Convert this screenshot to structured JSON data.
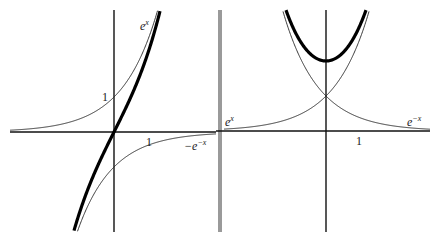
{
  "chart_data": [
    {
      "type": "line",
      "title": "",
      "panel": "left",
      "xlim": [
        -3.2,
        2.9
      ],
      "ylim": [
        -3.2,
        3.7
      ],
      "axes": {
        "x_tick_label": "1",
        "x_tick_value": 1,
        "y_tick_label": "1",
        "y_tick_value": 1
      },
      "series": [
        {
          "name": "e^x",
          "function": "exp(x)",
          "style": "thin",
          "label": {
            "base": "e",
            "exp": "x"
          }
        },
        {
          "name": "-e^-x",
          "function": "-exp(-x)",
          "style": "thin",
          "label": {
            "base": "−e",
            "exp": "−x"
          }
        },
        {
          "name": "sinh-like sum",
          "function": "exp(x) - exp(-x)",
          "style": "thick",
          "label": null
        }
      ]
    },
    {
      "type": "line",
      "title": "",
      "panel": "right",
      "xlim": [
        -3.1,
        3.2
      ],
      "ylim": [
        -3.0,
        3.7
      ],
      "axes": {
        "x_tick_label": "1",
        "x_tick_value": 1
      },
      "series": [
        {
          "name": "e^x",
          "function": "exp(x)",
          "style": "thin",
          "label": {
            "base": "e",
            "exp": "x"
          }
        },
        {
          "name": "e^-x",
          "function": "exp(-x)",
          "style": "thin",
          "label": {
            "base": "e",
            "exp": "−x"
          }
        },
        {
          "name": "cosh-like sum",
          "function": "exp(x) + exp(-x)",
          "style": "thick",
          "label": null
        }
      ]
    }
  ],
  "labels": {
    "left_ex_base": "e",
    "left_ex_exp": "x",
    "left_y_one": "1",
    "left_x_one": "1",
    "left_negemx_base": "−e",
    "left_negemx_exp": "−x",
    "right_ex_base": "e",
    "right_ex_exp": "x",
    "right_x_one": "1",
    "right_emx_base": "e",
    "right_emx_exp": "−x"
  }
}
